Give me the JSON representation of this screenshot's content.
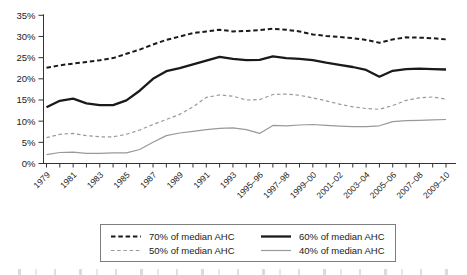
{
  "figure": {
    "background": "#ffffff",
    "axis_color": "#333333",
    "text_color": "#222222"
  },
  "chart_data": {
    "type": "line",
    "title": "",
    "xlabel": "",
    "ylabel": "",
    "ylim": [
      0,
      35
    ],
    "grid": false,
    "legend_position": "bottom-boxed",
    "y_tick_values": [
      0,
      5,
      10,
      15,
      20,
      25,
      30,
      35
    ],
    "y_tick_labels": [
      "0%",
      "5%",
      "10%",
      "15%",
      "20%",
      "25%",
      "30%",
      "35%"
    ],
    "x_categories": [
      "1979",
      "1980",
      "1981",
      "1982",
      "1983",
      "1984",
      "1985",
      "1986",
      "1987",
      "1988",
      "1989",
      "1990",
      "1991",
      "1992",
      "1993",
      "1994–95",
      "1995–96",
      "1996–97",
      "1997–98",
      "1998–99",
      "1999–00",
      "2000–01",
      "2001–02",
      "2002–03",
      "2003–04",
      "2004–05",
      "2005–06",
      "2006–07",
      "2007–08",
      "2008–09",
      "2009–10"
    ],
    "x_labeled_every": 2,
    "x_labeled_ticks": [
      "1979",
      "1981",
      "1983",
      "1985",
      "1987",
      "1989",
      "1991",
      "1993",
      "1995–96",
      "1997–98",
      "1999–00",
      "2001–02",
      "2003–04",
      "2005–06",
      "2007–08",
      "2009–10"
    ],
    "series": [
      {
        "name": "70% of median AHC",
        "style": "dashed",
        "color": "#1a1a1a",
        "width": 2,
        "values": [
          22.6,
          23.2,
          23.6,
          24.0,
          24.4,
          24.9,
          25.9,
          26.9,
          28.1,
          29.2,
          30.0,
          30.8,
          31.2,
          31.6,
          31.2,
          31.3,
          31.5,
          31.8,
          31.6,
          31.2,
          30.5,
          30.1,
          29.9,
          29.6,
          29.2,
          28.5,
          29.3,
          29.8,
          29.7,
          29.6,
          29.3
        ]
      },
      {
        "name": "60% of median AHC",
        "style": "solid",
        "color": "#1a1a1a",
        "width": 2.3,
        "values": [
          13.3,
          14.8,
          15.3,
          14.2,
          13.8,
          13.8,
          14.9,
          17.2,
          20.0,
          21.8,
          22.5,
          23.4,
          24.3,
          25.2,
          24.7,
          24.4,
          24.5,
          25.3,
          24.9,
          24.7,
          24.4,
          23.8,
          23.3,
          22.8,
          22.1,
          20.5,
          21.9,
          22.3,
          22.4,
          22.3,
          22.2
        ]
      },
      {
        "name": "50% of median AHC",
        "style": "dashed",
        "color": "#999999",
        "width": 1.2,
        "values": [
          6.1,
          6.9,
          7.1,
          6.6,
          6.3,
          6.3,
          6.9,
          7.9,
          9.2,
          10.4,
          11.6,
          13.4,
          15.6,
          16.2,
          15.9,
          15.0,
          15.1,
          16.3,
          16.4,
          16.1,
          15.5,
          14.8,
          14.0,
          13.4,
          13.0,
          12.8,
          13.7,
          14.9,
          15.5,
          15.7,
          15.2
        ]
      },
      {
        "name": "40% of median AHC",
        "style": "solid",
        "color": "#999999",
        "width": 1.2,
        "values": [
          2.1,
          2.6,
          2.7,
          2.4,
          2.4,
          2.5,
          2.5,
          3.3,
          5.0,
          6.6,
          7.2,
          7.6,
          8.0,
          8.3,
          8.4,
          8.0,
          7.1,
          9.0,
          8.9,
          9.1,
          9.2,
          9.0,
          8.8,
          8.7,
          8.7,
          8.9,
          9.9,
          10.1,
          10.2,
          10.3,
          10.4
        ]
      }
    ]
  }
}
